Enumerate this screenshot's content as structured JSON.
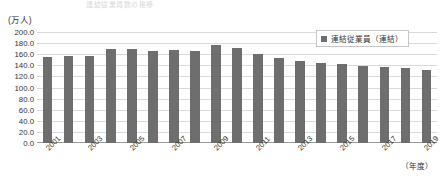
{
  "title": {
    "text": "連結従業員数の推移"
  },
  "axis": {
    "y_unit": "(万人)",
    "x_caption": "（年度）"
  },
  "legend": {
    "position": "top-right",
    "entries": [
      {
        "label": "連結従業員（連結）",
        "color": "#6e6e6e",
        "marker": "square-swatch"
      }
    ]
  },
  "colors": {
    "bar": "#6e6e6e",
    "gridline": "#d9d9d9",
    "axis": "#9a9a9a",
    "text": "#333333",
    "background": "#ffffff"
  },
  "chart_data": {
    "type": "bar",
    "title": "連結従業員数の推移",
    "xlabel": "（年度）",
    "ylabel": "(万人)",
    "ylim": [
      0,
      200
    ],
    "ytick_step": 20,
    "ytick_labels": [
      "0.0",
      "20.0",
      "40.0",
      "60.0",
      "80.0",
      "100.0",
      "120.0",
      "140.0",
      "160.0",
      "180.0",
      "200.0"
    ],
    "ytick_values": [
      0,
      20,
      40,
      60,
      80,
      100,
      120,
      140,
      160,
      180,
      200
    ],
    "grid": true,
    "legend_position": "top-right",
    "xtick_labels": [
      "2001",
      "2003",
      "2005",
      "2007",
      "2009",
      "2011",
      "2013",
      "2015",
      "2017",
      "2019"
    ],
    "categories": [
      "2001",
      "2002",
      "2003",
      "2004",
      "2005",
      "2006",
      "2007",
      "2008",
      "2009",
      "2010",
      "2011",
      "2012",
      "2013",
      "2014",
      "2015",
      "2016",
      "2017",
      "2018",
      "2019"
    ],
    "series": [
      {
        "name": "連結従業員（連結）",
        "color": "#6e6e6e",
        "values": [
          155.0,
          157.5,
          157.0,
          169.0,
          170.0,
          165.5,
          167.5,
          165.5,
          177.0,
          172.0,
          160.5,
          153.0,
          148.0,
          145.0,
          143.0,
          138.0,
          136.5,
          135.0,
          131.5
        ]
      }
    ]
  }
}
